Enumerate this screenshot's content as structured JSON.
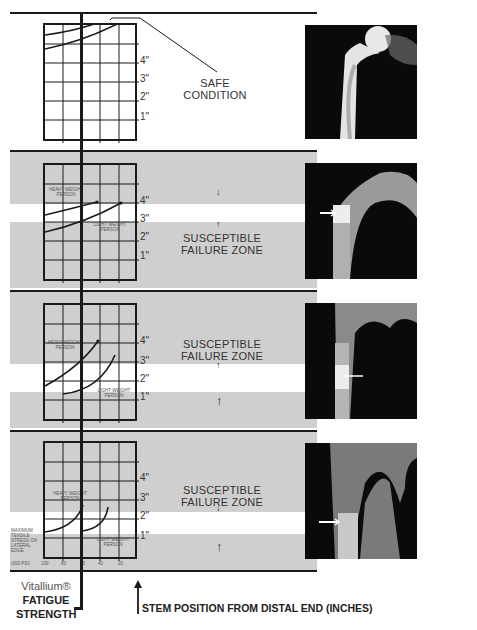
{
  "panels": [
    {
      "id": "safe",
      "label_lines": [
        "SAFE",
        "CONDITION"
      ],
      "inch_labels": [
        "4\"",
        "3\"",
        "2\"",
        "1\""
      ],
      "xray_arrow": false
    },
    {
      "id": "failure-1",
      "label_lines": [
        "SUSCEPTIBLE",
        "FAILURE ZONE"
      ],
      "inch_labels": [
        "4\"",
        "3\"",
        "2\"",
        "1\""
      ],
      "curve_labels": {
        "heavy": [
          "HEAVY WEIGHT",
          "PERSON"
        ],
        "light": [
          "LIGHT WEIGHT",
          "PERSON"
        ]
      },
      "xray_arrow": true
    },
    {
      "id": "failure-2",
      "label_lines": [
        "SUSCEPTIBLE",
        "FAILURE ZONE"
      ],
      "inch_labels": [
        "4\"",
        "3\"",
        "2\"",
        "1\""
      ],
      "curve_labels": {
        "heavy": [
          "HEAVY WEIGHT",
          "PERSON"
        ],
        "light": [
          "LIGHT WEIGHT",
          "PERSON"
        ]
      },
      "xray_arrow": true
    },
    {
      "id": "failure-3",
      "label_lines": [
        "SUSCEPTIBLE",
        "FAILURE ZONE"
      ],
      "inch_labels": [
        "4\"",
        "3\"",
        "2\"",
        "1\""
      ],
      "curve_labels": {
        "heavy": [
          "HEAVY WEIGHT",
          "PERSON"
        ],
        "light": [
          "LIGHT WEIGHT",
          "PERSON"
        ]
      },
      "xray_arrow": true
    }
  ],
  "axis": {
    "stress_label_lines": [
      "MAXIMUM",
      "TENSILE",
      "STRESS ON",
      "LATERAL",
      "EDGE"
    ],
    "unit": "(000 PSI)",
    "ticks": [
      "100",
      "80",
      "60",
      "40",
      "20"
    ]
  },
  "footer": {
    "fatigue_lines": [
      "Vitallium®",
      "FATIGUE",
      "STRENGTH"
    ],
    "stem_position": "STEM POSITION FROM DISTAL END (INCHES)"
  }
}
